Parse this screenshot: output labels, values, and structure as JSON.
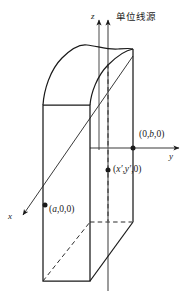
{
  "figure": {
    "kind": "3d-coordinate-diagram",
    "width": 186,
    "height": 299,
    "background_color": "#ffffff",
    "stroke_color": "#1a1a1a"
  },
  "axes": {
    "z_label": "z",
    "y_label": "y",
    "x_label": "x"
  },
  "annotations": {
    "unit_line_source": "单位线源",
    "point_b": "(0,b,0)",
    "point_b_parts": {
      "open": "(0,",
      "ital": "b",
      "close": ",0)"
    },
    "point_source": "(x′,y′,0)",
    "point_source_parts": {
      "open": "(",
      "ital_x": "x′",
      "mid": ",",
      "ital_y": "y′",
      "close": ",0)"
    },
    "point_a": "(a,0,0)",
    "point_a_parts": {
      "open": "(",
      "ital": "a",
      "close": ",0,0)"
    }
  },
  "markers": [
    {
      "name": "point-b-dot",
      "x": 133,
      "y": 148
    },
    {
      "name": "point-xy-dot",
      "x": 108,
      "y": 170
    },
    {
      "name": "point-a-dot",
      "x": 45,
      "y": 205
    }
  ],
  "geometry": {
    "origin": {
      "x": 90,
      "y": 148
    },
    "z_axis": {
      "x": 99,
      "top_y": 18,
      "bottom_y": 150
    },
    "y_axis": {
      "y": 148,
      "left_x": 90,
      "right_x": 181
    },
    "x_axis": {
      "from": {
        "x": 133,
        "y": 56
      },
      "to": {
        "x": 20,
        "y": 218
      }
    },
    "source_line": {
      "x": 108,
      "top_y": 18,
      "bottom_y": 291
    },
    "slab_front_top_left": {
      "x": 43,
      "y": 105
    },
    "slab_front_top_right": {
      "x": 90,
      "y": 105
    },
    "slab_front_bottom_left": {
      "x": 43,
      "y": 281
    },
    "slab_front_bottom_right": {
      "x": 90,
      "y": 281
    },
    "slab_back_top_right": {
      "x": 133,
      "y": 49
    },
    "slab_back_bottom_right": {
      "x": 133,
      "y": 222
    },
    "dashed_vertical_x": 108,
    "dashed_horizontal_y": 222
  }
}
